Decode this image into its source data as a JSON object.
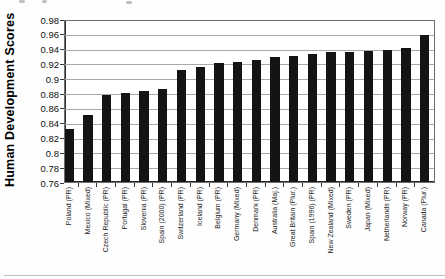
{
  "chart_data": {
    "type": "bar",
    "title": "",
    "ylabel": "Human Development Scores",
    "xlabel": "",
    "ylim": [
      0.76,
      0.98
    ],
    "ytick_step": 0.02,
    "ytick_labels": [
      "0.98",
      "0.96",
      "0.94",
      "0.92",
      "0.9",
      "0.88",
      "0.86",
      "0.84",
      "0.82",
      "0.8",
      "0.78",
      "0.76"
    ],
    "grid": "horizontal",
    "legend": "none",
    "bar_color": "#141414",
    "gridline_color": "#a9a9a9",
    "axis_color": "#2e2e2e",
    "categories": [
      "Poland (PR)",
      "Mexico (Mixed)",
      "Czech Republic (PR)",
      "Portugal (PR)",
      "Slovenia (PR)",
      "Spain (2000) (PR)",
      "Switzerland (PR)",
      "Iceland (PR)",
      "Belgium (PR)",
      "Germany (Mixed)",
      "Denmark (PR)",
      "Australia (Maj.)",
      "Great Britain (Plur.)",
      "Spain (1996) (PR)",
      "New Zealand (Mixed)",
      "Sweden (PR)",
      "Japan (Mixed)",
      "Netherlands (PR)",
      "Norway (PR)",
      "Canada (Plur.)"
    ],
    "values": [
      0.831,
      0.851,
      0.878,
      0.88,
      0.883,
      0.885,
      0.911,
      0.915,
      0.92,
      0.922,
      0.925,
      0.929,
      0.93,
      0.933,
      0.935,
      0.936,
      0.937,
      0.938,
      0.941,
      0.958
    ]
  }
}
